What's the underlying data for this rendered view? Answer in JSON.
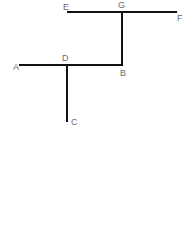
{
  "diagram": {
    "type": "line-segment-figure",
    "colors": {
      "line": "#111111",
      "label": "#6b6b6b",
      "background": "#ffffff"
    },
    "points": {
      "A": {
        "label": "A",
        "x": 20,
        "y": 65
      },
      "B": {
        "label": "B",
        "x": 122,
        "y": 65
      },
      "C": {
        "label": "C",
        "x": 67,
        "y": 121
      },
      "D": {
        "label": "D",
        "x": 67,
        "y": 65
      },
      "E": {
        "label": "E",
        "x": 68,
        "y": 12
      },
      "F": {
        "label": "F",
        "x": 176,
        "y": 12
      },
      "G": {
        "label": "G",
        "x": 122,
        "y": 12
      }
    },
    "segments": [
      {
        "name": "EF",
        "from": "E",
        "to": "F"
      },
      {
        "name": "GB",
        "from": "G",
        "to": "B"
      },
      {
        "name": "AB",
        "from": "A",
        "to": "B"
      },
      {
        "name": "DC",
        "from": "D",
        "to": "C"
      }
    ]
  }
}
